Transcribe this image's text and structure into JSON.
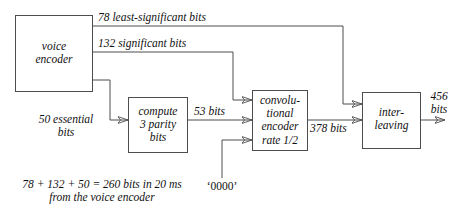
{
  "diagram": {
    "stroke_color": "#4d4d4d",
    "text_color": "#111111",
    "background": "#ffffff",
    "blocks": [
      {
        "id": "voice-encoder",
        "lines": [
          "voice",
          "encoder"
        ]
      },
      {
        "id": "compute-parity",
        "lines": [
          "compute",
          "3 parity",
          "bits"
        ]
      },
      {
        "id": "convolutional-encoder",
        "lines": [
          "convolu-",
          "tional",
          "encoder",
          "rate 1/2"
        ]
      },
      {
        "id": "interleaving",
        "lines": [
          "inter-",
          "leaving"
        ]
      }
    ],
    "edge_labels": {
      "least_significant": "78 least-significant bits",
      "significant": "132 significant bits",
      "essential_line1": "50 essential",
      "essential_line2": "bits",
      "parity_out": "53 bits",
      "conv_out": "378 bits",
      "final_line1": "456",
      "final_line2": "bits",
      "zeros": "‘0000’"
    },
    "caption": {
      "line1": "78 + 132 + 50 = 260 bits in 20 ms",
      "line2": "from the voice encoder"
    }
  }
}
